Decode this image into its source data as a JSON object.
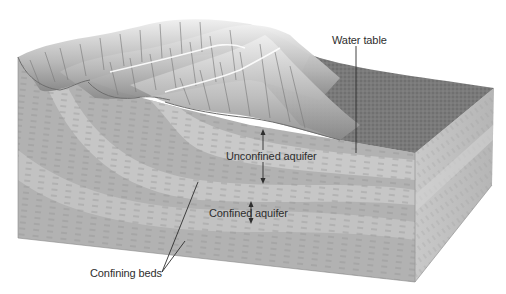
{
  "diagram": {
    "labels": {
      "water_table": "Water table",
      "unconfined_aquifer": "Unconfined aquifer",
      "confined_aquifer_left": "Confined",
      "confined_aquifer_right": "aquifer",
      "confining_beds": "Confining beds"
    },
    "colors": {
      "ridge_light": "#e6e6e6",
      "ridge_shadow": "#8c8c8c",
      "top_surface": "#7e7e7e",
      "front_face": "#b4b4b4",
      "aquifer_band": "#c8c8c8",
      "confining_bed": "#a8a8a8",
      "right_face": "#c0c0c0",
      "leader_line": "#2e2e2e",
      "text": "#2e2e2e"
    }
  }
}
